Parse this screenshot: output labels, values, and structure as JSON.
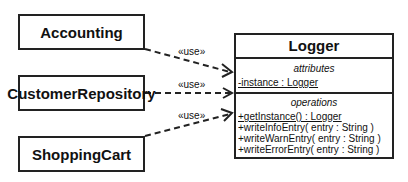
{
  "clients": [
    {
      "name": "Accounting"
    },
    {
      "name": "CustomerRepository"
    },
    {
      "name": "ShoppingCart"
    }
  ],
  "relations": [
    {
      "from": "Accounting",
      "to": "Logger",
      "label": "«use»"
    },
    {
      "from": "CustomerRepository",
      "to": "Logger",
      "label": "«use»"
    },
    {
      "from": "ShoppingCart",
      "to": "Logger",
      "label": "«use»"
    }
  ],
  "logger": {
    "title": "Logger",
    "attributes_label": "attributes",
    "attributes": [
      "-instance : Logger"
    ],
    "operations_label": "operations",
    "operations": [
      "+getInstance() : Logger",
      "+writeInfoEntry( entry : String )",
      "+writeWarnEntry( entry : String )",
      "+writeErrorEntry( entry : String )"
    ]
  }
}
